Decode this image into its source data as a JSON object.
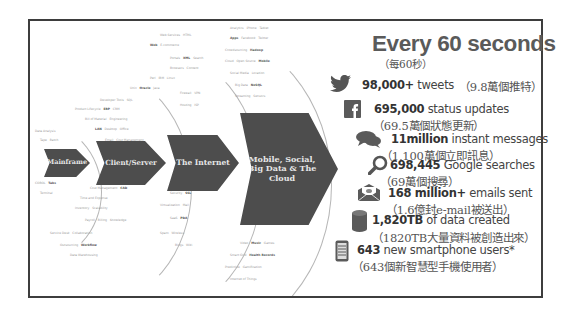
{
  "headline": {
    "title": "Every 60 seconds",
    "subtitle": "（每60秒）"
  },
  "eras": [
    {
      "label": "Mainframe"
    },
    {
      "label": "Client/Server"
    },
    {
      "label": "The Internet"
    },
    {
      "label_line1": "Mobile, Social,",
      "label_line2": "Big Data & The Cloud"
    }
  ],
  "stats": [
    {
      "icon": "twitter-bird-icon",
      "value": "98,000+",
      "text": " tweets",
      "zh": "（9.8萬個推特）"
    },
    {
      "icon": "facebook-icon",
      "value": "695,000",
      "text": " status updates",
      "zh": "（69.5萬個狀態更新）"
    },
    {
      "icon": "chat-bubbles-icon",
      "value": "11million",
      "text": " instant messages",
      "zh": "（1,100萬個立即訊息）"
    },
    {
      "icon": "magnifier-icon",
      "value": "698,445",
      "text": " Google searches",
      "zh": "（69萬個搜尋）"
    },
    {
      "icon": "envelope-icon",
      "value": "168 million+",
      "text": " emails sent",
      "zh": "（1.6億封e-mail被送出）"
    },
    {
      "icon": "database-icon",
      "value": "1,820TB",
      "text": " of data created",
      "zh": "（1820TB大量資料被創造出來）"
    },
    {
      "icon": "smartphone-icon",
      "value": "643",
      "text": " new smartphone users*",
      "zh": "（643個新智慧型手機使用者）"
    }
  ],
  "colors": {
    "arrow": "#4d4d4d",
    "arrow_text": "#e6e6e6",
    "headline": "#5a5a5a",
    "frame": "#3d3d3d"
  }
}
